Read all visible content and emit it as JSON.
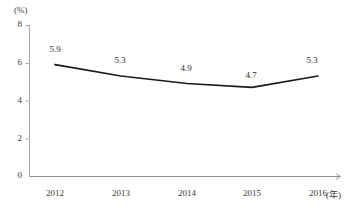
{
  "chart_data": {
    "type": "line",
    "title": "",
    "subtitle": "",
    "xlabel": "(年)",
    "ylabel": "(%)",
    "categories": [
      "2012",
      "2013",
      "2014",
      "2015",
      "2016"
    ],
    "x": [
      2012,
      2013,
      2014,
      2015,
      2016
    ],
    "values": [
      5.9,
      5.3,
      4.9,
      4.7,
      5.3
    ],
    "data_labels": [
      "5.9",
      "5.3",
      "4.9",
      "4.7",
      "5.3"
    ],
    "series": [
      {
        "name": "",
        "values": [
          5.9,
          5.3,
          4.9,
          4.7,
          5.3
        ]
      }
    ],
    "ylim": [
      0,
      8
    ],
    "yticks": [
      0,
      2,
      4,
      6,
      8
    ],
    "ytick_labels": [
      "0",
      "2",
      "4",
      "6",
      "8"
    ],
    "xtick_labels": [
      "2012",
      "2013",
      "2014",
      "2015",
      "2016"
    ],
    "grid": false,
    "legend": false,
    "legend_position": "none",
    "markers": false,
    "line_color": "#1a1a1a",
    "axis_color": "#a8a8a8",
    "text_color": "#3a3a3a"
  },
  "axes": {
    "y_unit": "(%)",
    "x_unit": "(年)",
    "y_ticks": [
      {
        "label": "8",
        "value": 8
      },
      {
        "label": "6",
        "value": 6
      },
      {
        "label": "4",
        "value": 4
      },
      {
        "label": "2",
        "value": 2
      },
      {
        "label": "0",
        "value": 0
      }
    ],
    "x_ticks": [
      {
        "label": "2012"
      },
      {
        "label": "2013"
      },
      {
        "label": "2014"
      },
      {
        "label": "2015"
      },
      {
        "label": "2016"
      }
    ]
  },
  "points": [
    {
      "label": "5.9",
      "year": "2012",
      "value": 5.9
    },
    {
      "label": "5.3",
      "year": "2013",
      "value": 5.3
    },
    {
      "label": "4.9",
      "year": "2014",
      "value": 4.9
    },
    {
      "label": "4.7",
      "year": "2015",
      "value": 4.7
    },
    {
      "label": "5.3",
      "year": "2016",
      "value": 5.3
    }
  ]
}
